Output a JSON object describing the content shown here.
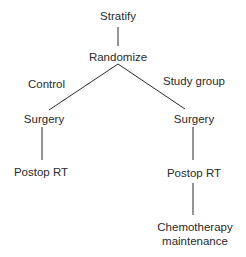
{
  "diagram": {
    "type": "flowchart-tree",
    "nodes": {
      "stratify": "Stratify",
      "randomize": "Randomize",
      "surgery_control": "Surgery",
      "postop_rt_control": "Postop RT",
      "surgery_study": "Surgery",
      "postop_rt_study": "Postop RT",
      "chemo_line1": "Chemotherapy",
      "chemo_line2": "maintenance"
    },
    "branch_labels": {
      "control": "Control",
      "study_group": "Study group"
    },
    "edges": [
      [
        "Stratify",
        "Randomize"
      ],
      [
        "Randomize",
        "Surgery (Control)"
      ],
      [
        "Randomize",
        "Surgery (Study group)"
      ],
      [
        "Surgery (Control)",
        "Postop RT (Control)"
      ],
      [
        "Surgery (Study group)",
        "Postop RT (Study group)"
      ],
      [
        "Postop RT (Study group)",
        "Chemotherapy maintenance"
      ]
    ],
    "colors": {
      "line": "#2a2a2a",
      "text": "#2a2a2a",
      "background": "#ffffff"
    }
  }
}
